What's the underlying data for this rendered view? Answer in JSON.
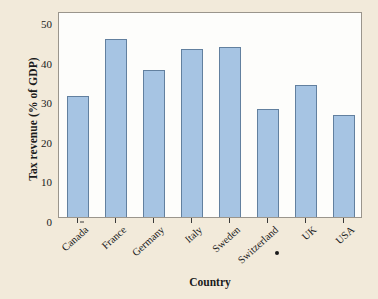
{
  "chart_data": {
    "type": "bar",
    "title": "",
    "xlabel": "Country",
    "ylabel": "Tax revenue (% of GDP)",
    "categories": [
      "Canada",
      "France",
      "Germany",
      "Italy",
      "Sweden",
      "Switzerland",
      "UK",
      "USA"
    ],
    "values": [
      30.5,
      45.0,
      37.0,
      42.5,
      43.0,
      27.3,
      33.2,
      25.7
    ],
    "ylim": [
      0,
      52
    ],
    "yticks": [
      0,
      10,
      20,
      30,
      40,
      50
    ],
    "ytick_labels": [
      "0",
      "10",
      "20",
      "30",
      "40",
      "50"
    ],
    "grid": false,
    "legend": "none",
    "bar_fill_color": "#a6c4e3",
    "bar_edge_color": "#62809f",
    "plot_background_color": "#fdfdfb",
    "figure_background_color": "#f2eada",
    "axis_color": "#9a958c",
    "text_color": "#1a1a1a"
  },
  "artifacts": {
    "ink_dot": "•"
  }
}
